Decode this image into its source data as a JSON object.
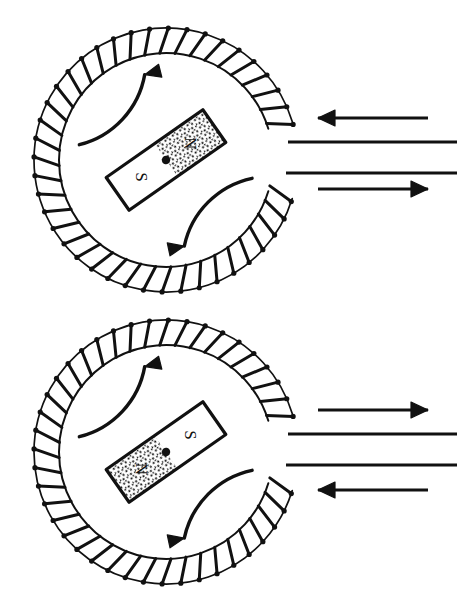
{
  "figure": {
    "background_color": "#ffffff",
    "ink_color": "#111111",
    "width": 457,
    "height": 609
  },
  "panels": [
    {
      "id": "panel-top",
      "name": "top-panel",
      "coil": {
        "name": "coil-winding",
        "center_x": 166,
        "center_y": 160,
        "inner_radius": 107,
        "outer_radius": 132,
        "turns": 40,
        "gap_start_deg": -17,
        "gap_end_deg": 17,
        "node_dot_radius": 2.6
      },
      "magnet": {
        "name": "bar-magnet",
        "center_x": 166,
        "center_y": 160,
        "length": 118,
        "width": 40,
        "angle_deg": -35,
        "north_label": "N",
        "south_label": "S",
        "north_end": "upper-right",
        "south_end": "lower-left",
        "north_fill": "stipple",
        "south_fill": "white",
        "pivot_dot_radius": 4.2,
        "label_rotation_deg": 125
      },
      "rotation_arrows": [
        {
          "name": "rotation-arrow-upper-left",
          "direction": "clockwise",
          "start_deg": 190,
          "end_deg": 256,
          "radius": 88
        },
        {
          "name": "rotation-arrow-lower-right",
          "direction": "clockwise",
          "start_deg": 12,
          "end_deg": 78,
          "radius": 88
        }
      ],
      "leads": [
        {
          "name": "lead-wire-upper",
          "y": 142,
          "x_start": 288,
          "x_end": 457
        },
        {
          "name": "lead-wire-lower",
          "y": 173,
          "x_start": 286,
          "x_end": 457
        }
      ],
      "current_arrows": [
        {
          "name": "current-arrow-top",
          "direction": "left",
          "y": 118,
          "x_start": 318,
          "x_end": 428
        },
        {
          "name": "current-arrow-bottom",
          "direction": "right",
          "y": 189,
          "x_start": 318,
          "x_end": 428
        }
      ]
    },
    {
      "id": "panel-bottom",
      "name": "bottom-panel",
      "coil": {
        "name": "coil-winding",
        "center_x": 166,
        "center_y": 452,
        "inner_radius": 107,
        "outer_radius": 132,
        "turns": 40,
        "gap_start_deg": -17,
        "gap_end_deg": 17,
        "node_dot_radius": 2.6
      },
      "magnet": {
        "name": "bar-magnet",
        "center_x": 166,
        "center_y": 452,
        "length": 118,
        "width": 40,
        "angle_deg": -35,
        "north_label": "N",
        "south_label": "S",
        "north_end": "lower-left",
        "south_end": "upper-right",
        "north_fill": "stipple",
        "south_fill": "white",
        "pivot_dot_radius": 4.2,
        "label_rotation_deg": 125
      },
      "rotation_arrows": [
        {
          "name": "rotation-arrow-upper-left",
          "direction": "clockwise",
          "start_deg": 190,
          "end_deg": 256,
          "radius": 88
        },
        {
          "name": "rotation-arrow-lower-right",
          "direction": "clockwise",
          "start_deg": 12,
          "end_deg": 78,
          "radius": 88
        }
      ],
      "leads": [
        {
          "name": "lead-wire-upper",
          "y": 434,
          "x_start": 288,
          "x_end": 457
        },
        {
          "name": "lead-wire-lower",
          "y": 465,
          "x_start": 286,
          "x_end": 457
        }
      ],
      "current_arrows": [
        {
          "name": "current-arrow-top",
          "direction": "right",
          "y": 410,
          "x_start": 318,
          "x_end": 428
        },
        {
          "name": "current-arrow-bottom",
          "direction": "left",
          "y": 490,
          "x_start": 318,
          "x_end": 428
        }
      ]
    }
  ]
}
